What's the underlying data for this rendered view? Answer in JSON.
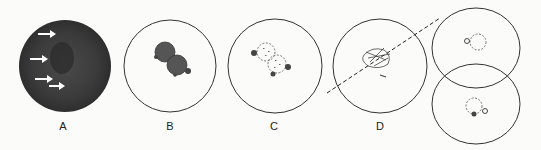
{
  "panels": [
    {
      "id": "A",
      "label": "A",
      "description": "dark stained cell with white arrows"
    },
    {
      "id": "B",
      "label": "B",
      "description": "two dark adjacent spheres"
    },
    {
      "id": "C",
      "label": "C",
      "description": "two dotted spheres with small bodies"
    },
    {
      "id": "D",
      "label": "D",
      "description": "tangled structure bisected by dashed line"
    },
    {
      "id": "E",
      "label": "",
      "description": "two overlapping daughter cells"
    }
  ],
  "colors": {
    "background": "#fbfbfa",
    "stroke": "#333333",
    "cell_dark": "#3a3a3a",
    "sphere_dark": "#555555",
    "arrow": "#ffffff"
  }
}
